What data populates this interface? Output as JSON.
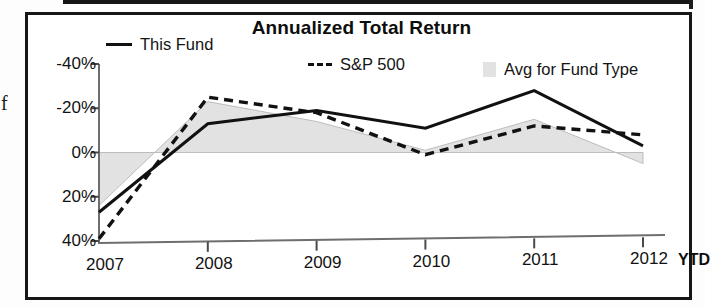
{
  "panel": {
    "title": "Annualized Total Return"
  },
  "legend": {
    "position": "top",
    "items": [
      {
        "label": "This Fund",
        "marker": "solid-line-swatch",
        "color": "#111111"
      },
      {
        "label": "S&P 500",
        "marker": "dashed-line-swatch",
        "color": "#111111"
      },
      {
        "label": "Avg for Fund Type",
        "marker": "area-swatch",
        "color": "#e2e2e2"
      }
    ]
  },
  "axes": {
    "y_ticks": [
      "40%",
      "20%",
      "0%",
      "-20%",
      "-40%"
    ],
    "x_ticks": [
      "2007",
      "2008",
      "2009",
      "2010",
      "2011",
      "2012"
    ],
    "x_ytd_label": "YTD"
  },
  "chart_data": {
    "type": "line",
    "title": "Annualized Total Return",
    "xlabel": "",
    "ylabel": "",
    "categories": [
      "2007",
      "2008",
      "2009",
      "2010",
      "2011",
      "2012"
    ],
    "ylim": [
      -40,
      40
    ],
    "yticks": [
      -40,
      -20,
      0,
      20,
      40
    ],
    "ytick_labels": [
      "-40%",
      "-20%",
      "0%",
      "-20%",
      "40%"
    ],
    "grid": false,
    "legend_position": "top",
    "series": [
      {
        "name": "This Fund",
        "style": "solid",
        "color": "#111111",
        "values": [
          -27,
          13,
          19,
          11,
          28,
          3
        ]
      },
      {
        "name": "S&P 500",
        "style": "dashed",
        "color": "#111111",
        "values": [
          -39,
          25,
          18,
          -1,
          12,
          8
        ]
      },
      {
        "name": "Avg for Fund Type",
        "style": "filled-area",
        "color": "#e2e2e2",
        "values": [
          -24,
          23,
          14,
          1,
          15,
          -5
        ]
      }
    ],
    "annotations": [
      "YTD"
    ]
  }
}
